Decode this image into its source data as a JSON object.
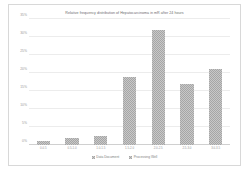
{
  "chart_data": {
    "type": "bar",
    "title": "Relative frequency distribution of Hepatocarcinoma in mR after 24 hours",
    "xlabel": "",
    "ylabel": "",
    "ylim": [
      0,
      35
    ],
    "ytick_step": 5,
    "ytick_labels": [
      "0%",
      "5%",
      "10%",
      "15%",
      "20%",
      "25%",
      "30%",
      "35%"
    ],
    "ytick_values": [
      0,
      5,
      10,
      15,
      20,
      25,
      30,
      35
    ],
    "grid": true,
    "legend_position": "bottom",
    "categories": [
      "0-0.5",
      "0.5-1.0",
      "1.0-1.5",
      "1.5-2.0",
      "2.0-2.5",
      "2.5-3.0",
      "3.0-3.5"
    ],
    "series": [
      {
        "name": "Data Document",
        "values": [
          1,
          2,
          2.5,
          19,
          32,
          17,
          21
        ]
      }
    ],
    "legend": [
      {
        "label": "Data Document",
        "color": "#a6a6a6"
      },
      {
        "label": "Processing Well",
        "color": "#a6a6a6"
      }
    ]
  }
}
